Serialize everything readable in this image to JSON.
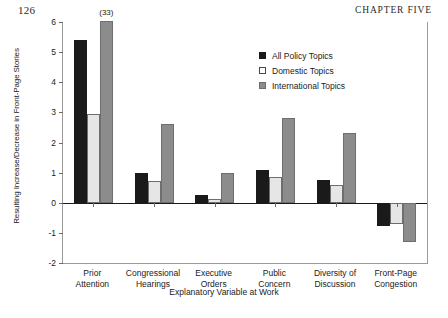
{
  "page": {
    "folio": "126",
    "running_head": "CHAPTER FIVE"
  },
  "legend": {
    "position": "top-right",
    "items": [
      {
        "label": "All Policy Topics",
        "swatch": "filled-square-black-icon",
        "color": "#1a1a1a"
      },
      {
        "label": "Domestic Topics",
        "swatch": "open-square-white-icon",
        "color": "#ffffff"
      },
      {
        "label": "International Topics",
        "swatch": "filled-square-gray-icon",
        "color": "#8c8c8c"
      }
    ]
  },
  "chart_data": {
    "type": "bar",
    "title": "",
    "xlabel": "Explanatory Variable at Work",
    "ylabel": "Resulting Increase/Decrease in Front-Page Stories",
    "categories": [
      "Prior\nAttention",
      "Congressional\nHearings",
      "Executive\nOrders",
      "Public\nConcern",
      "Diversity of\nDiscussion",
      "Front-Page\nCongestion"
    ],
    "category_lines": [
      [
        "Prior",
        "Attention"
      ],
      [
        "Congressional",
        "Hearings"
      ],
      [
        "Executive",
        "Orders"
      ],
      [
        "Public",
        "Concern"
      ],
      [
        "Diversity of",
        "Discussion"
      ],
      [
        "Front-Page",
        "Congestion"
      ]
    ],
    "series": [
      {
        "name": "All Policy Topics",
        "color": "#1a1a1a",
        "values": [
          5.4,
          1.0,
          0.25,
          1.1,
          0.75,
          -0.78
        ]
      },
      {
        "name": "Domestic Topics",
        "color": "#e6e6e6",
        "values": [
          2.95,
          0.72,
          0.12,
          0.85,
          0.6,
          -0.7
        ]
      },
      {
        "name": "International Topics",
        "color": "#8c8c8c",
        "values": [
          6.05,
          2.6,
          1.0,
          2.8,
          2.3,
          -1.3
        ]
      }
    ],
    "annotations": [
      {
        "text": "(33)",
        "category": "Prior Attention",
        "series": "International Topics",
        "value": 6.05
      }
    ],
    "ylim": [
      -2,
      6
    ],
    "yticks": [
      6,
      5,
      4,
      3,
      2,
      1,
      0,
      -1,
      -2
    ],
    "ytick_labels": [
      "6",
      "5",
      "4",
      "3",
      "2",
      "1",
      "0",
      "-1",
      "-2"
    ],
    "grid": false
  }
}
